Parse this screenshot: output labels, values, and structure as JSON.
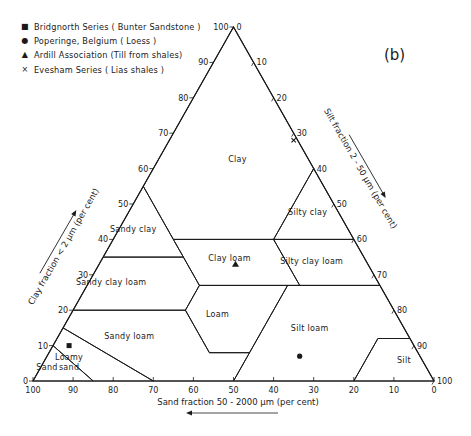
{
  "panel_label": "(b)",
  "legend": [
    {
      "symbol": "square",
      "glyph": "■",
      "label": "Bridgnorth Series ( Bunter Sandstone )"
    },
    {
      "symbol": "circle",
      "glyph": "●",
      "label": "Poperinge, Belgium ( Loess )"
    },
    {
      "symbol": "triangle",
      "glyph": "▲",
      "label": "Ardill Association (Till from shales)"
    },
    {
      "symbol": "cross",
      "glyph": "×",
      "label": "Evesham Series ( Lias shales )"
    }
  ],
  "axes": {
    "clay_label": "Clay fraction < 2 μm (per cent)",
    "silt_label": "Silt fraction 2 - 50 μm (per cent)",
    "sand_label": "Sand fraction 50 - 2000 μm (per cent)",
    "ticks": [
      0,
      10,
      20,
      30,
      40,
      50,
      60,
      70,
      80,
      90,
      100
    ]
  },
  "chart_data": {
    "type": "ternary",
    "axes": {
      "left": "Clay fraction < 2 μm (per cent)",
      "right": "Silt fraction 2 - 50 μm (per cent)",
      "bottom": "Sand fraction 50 - 2000 μm (per cent)"
    },
    "tick_values": [
      0,
      10,
      20,
      30,
      40,
      50,
      60,
      70,
      80,
      90,
      100
    ],
    "regions": [
      {
        "name": "Clay",
        "label_at": {
          "clay": 62,
          "silt": 20
        },
        "vertices": [
          {
            "clay": 100,
            "silt": 0
          },
          {
            "clay": 55,
            "silt": 0
          },
          {
            "clay": 40,
            "silt": 15
          },
          {
            "clay": 40,
            "silt": 40
          },
          {
            "clay": 60,
            "silt": 40
          }
        ]
      },
      {
        "name": "Sandy clay",
        "label_at": {
          "clay": 42,
          "silt": 4
        },
        "vertices": [
          {
            "clay": 55,
            "silt": 0
          },
          {
            "clay": 35,
            "silt": 0
          },
          {
            "clay": 35,
            "silt": 20
          }
        ]
      },
      {
        "name": "Silty clay",
        "label_at": {
          "clay": 47,
          "silt": 45
        },
        "vertices": [
          {
            "clay": 60,
            "silt": 40
          },
          {
            "clay": 40,
            "silt": 40
          },
          {
            "clay": 40,
            "silt": 60
          }
        ]
      },
      {
        "name": "Clay loam",
        "label_at": {
          "clay": 34,
          "silt": 32
        },
        "vertices": [
          {
            "clay": 40,
            "silt": 15
          },
          {
            "clay": 35,
            "silt": 20
          },
          {
            "clay": 27,
            "silt": 28
          },
          {
            "clay": 27,
            "silt": 53
          },
          {
            "clay": 40,
            "silt": 40
          }
        ]
      },
      {
        "name": "Sandy clay loam",
        "label_at": {
          "clay": 27,
          "silt": 6
        },
        "vertices": [
          {
            "clay": 35,
            "silt": 0
          },
          {
            "clay": 20,
            "silt": 0
          },
          {
            "clay": 20,
            "silt": 28
          },
          {
            "clay": 27,
            "silt": 28
          },
          {
            "clay": 35,
            "silt": 20
          }
        ]
      },
      {
        "name": "Silty clay loam",
        "label_at": {
          "clay": 33,
          "silt": 53
        },
        "vertices": [
          {
            "clay": 40,
            "silt": 40
          },
          {
            "clay": 27,
            "silt": 53
          },
          {
            "clay": 27,
            "silt": 73
          },
          {
            "clay": 40,
            "silt": 60
          }
        ]
      },
      {
        "name": "Loam",
        "label_at": {
          "clay": 18,
          "silt": 37
        },
        "vertices": [
          {
            "clay": 27,
            "silt": 28
          },
          {
            "clay": 20,
            "silt": 28
          },
          {
            "clay": 8,
            "silt": 40
          },
          {
            "clay": 8,
            "silt": 50
          },
          {
            "clay": 27,
            "silt": 50
          }
        ]
      },
      {
        "name": "Sandy loam",
        "label_at": {
          "clay": 12,
          "silt": 18
        },
        "vertices": [
          {
            "clay": 20,
            "silt": 0
          },
          {
            "clay": 15,
            "silt": 0
          },
          {
            "clay": 0,
            "silt": 30
          },
          {
            "clay": 0,
            "silt": 50
          },
          {
            "clay": 8,
            "silt": 50
          },
          {
            "clay": 8,
            "silt": 40
          },
          {
            "clay": 20,
            "silt": 28
          }
        ]
      },
      {
        "name": "Silt loam",
        "label_at": {
          "clay": 14,
          "silt": 62
        },
        "vertices": [
          {
            "clay": 27,
            "silt": 50
          },
          {
            "clay": 0,
            "silt": 50
          },
          {
            "clay": 0,
            "silt": 80
          },
          {
            "clay": 12,
            "silt": 80
          },
          {
            "clay": 12,
            "silt": 88
          },
          {
            "clay": 27,
            "silt": 73
          }
        ]
      },
      {
        "name": "Loamy sand",
        "label_at": {
          "clay": 6,
          "silt": 6
        },
        "vertices": [
          {
            "clay": 15,
            "silt": 0
          },
          {
            "clay": 10,
            "silt": 0
          },
          {
            "clay": 0,
            "silt": 15
          },
          {
            "clay": 0,
            "silt": 30
          }
        ]
      },
      {
        "name": "Sand",
        "label_at": {
          "clay": 3,
          "silt": 2
        },
        "vertices": [
          {
            "clay": 10,
            "silt": 0
          },
          {
            "clay": 0,
            "silt": 0
          },
          {
            "clay": 0,
            "silt": 15
          }
        ]
      },
      {
        "name": "Silt",
        "label_at": {
          "clay": 5,
          "silt": 90
        },
        "vertices": [
          {
            "clay": 12,
            "silt": 80
          },
          {
            "clay": 0,
            "silt": 80
          },
          {
            "clay": 0,
            "silt": 100
          },
          {
            "clay": 12,
            "silt": 88
          }
        ]
      }
    ],
    "points": [
      {
        "series": "Bridgnorth Series (Bunter Sandstone)",
        "marker": "square",
        "clay": 10,
        "silt": 4,
        "sand": 86
      },
      {
        "series": "Poperinge, Belgium (Loess)",
        "marker": "circle",
        "clay": 7,
        "silt": 63,
        "sand": 30
      },
      {
        "series": "Ardill Association (Till from shales)",
        "marker": "triangle",
        "clay": 33,
        "silt": 34,
        "sand": 33
      },
      {
        "series": "Evesham Series (Lias shales)",
        "marker": "cross",
        "clay": 68,
        "silt": 31,
        "sand": 1
      }
    ],
    "colors": {
      "line": "#1a1a1a",
      "background": "#ffffff"
    }
  }
}
